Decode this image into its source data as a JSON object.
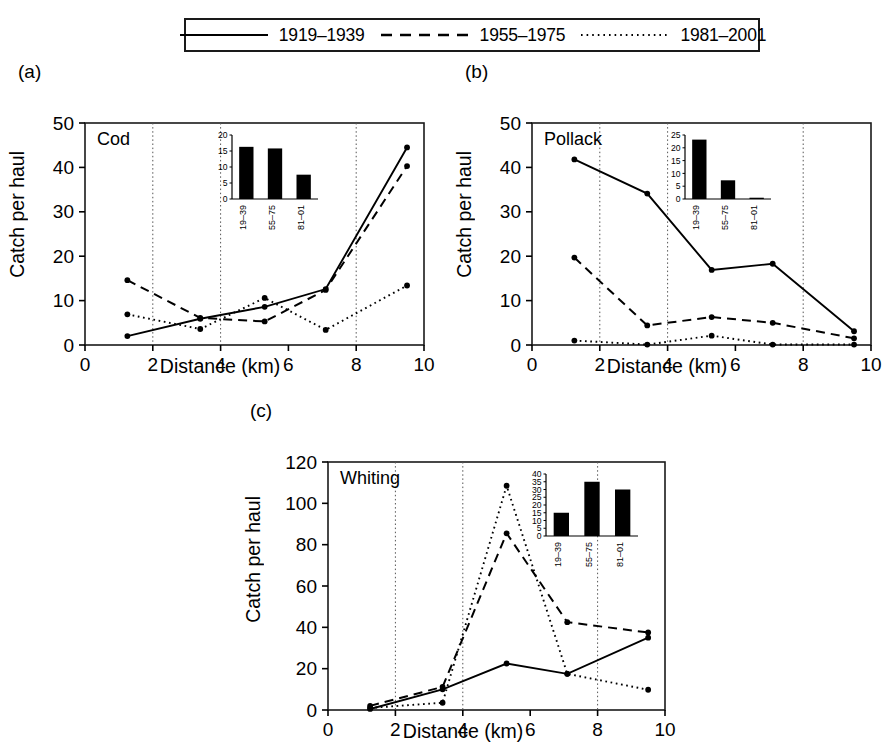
{
  "legend": {
    "entries": [
      {
        "label": "1919–1939",
        "style": "solid",
        "icon": "solid-line-icon"
      },
      {
        "label": "1955–1975",
        "style": "dashed",
        "icon": "dashed-line-icon"
      },
      {
        "label": "1981–2001",
        "style": "dotted",
        "icon": "dotted-line-icon"
      }
    ]
  },
  "axes": {
    "xlabel": "Distance (km)",
    "ylabel": "Catch per haul"
  },
  "panels": [
    {
      "tag": "(a)",
      "species": "Cod"
    },
    {
      "tag": "(b)",
      "species": "Pollack"
    },
    {
      "tag": "(c)",
      "species": "Whiting"
    }
  ],
  "chart_data": [
    {
      "type": "line",
      "panel": "(a)",
      "title": "Cod",
      "xlabel": "Distance (km)",
      "ylabel": "Catch per haul",
      "xlim": [
        0,
        10
      ],
      "ylim": [
        0,
        50
      ],
      "xticks": [
        0,
        2,
        4,
        6,
        8,
        10
      ],
      "yticks": [
        0,
        10,
        20,
        30,
        40,
        50
      ],
      "grid": "vertical dotted gridlines at x = 2, 4, 8",
      "gridlines_x": [
        2,
        4,
        8
      ],
      "legend_position": "top, outside (shared)",
      "x": [
        1.25,
        3.4,
        5.3,
        7.1,
        9.5
      ],
      "series": [
        {
          "name": "1919–1939",
          "style": "solid",
          "values": [
            2.0,
            5.9,
            8.6,
            12.6,
            44.5
          ]
        },
        {
          "name": "1955–1975",
          "style": "dashed",
          "values": [
            14.6,
            6.1,
            5.3,
            12.4,
            40.3
          ]
        },
        {
          "name": "1981–2001",
          "style": "dotted",
          "values": [
            6.9,
            3.6,
            10.6,
            3.4,
            13.4
          ]
        }
      ],
      "inset": {
        "type": "bar",
        "categories": [
          "19–39",
          "55–75",
          "81–01"
        ],
        "values": [
          16.3,
          15.8,
          7.6
        ],
        "ylim": [
          0,
          20
        ],
        "yticks": [
          0,
          5,
          10,
          15,
          20
        ]
      }
    },
    {
      "type": "line",
      "panel": "(b)",
      "title": "Pollack",
      "xlabel": "Distance (km)",
      "ylabel": "Catch per haul",
      "xlim": [
        0,
        10
      ],
      "ylim": [
        0,
        50
      ],
      "xticks": [
        0,
        2,
        4,
        6,
        8,
        10
      ],
      "yticks": [
        0,
        10,
        20,
        30,
        40,
        50
      ],
      "grid": "vertical dotted gridlines at x = 2, 4, 8",
      "gridlines_x": [
        2,
        4,
        8
      ],
      "legend_position": "top, outside (shared)",
      "x": [
        1.25,
        3.4,
        5.3,
        7.1,
        9.5
      ],
      "series": [
        {
          "name": "1919–1939",
          "style": "solid",
          "values": [
            41.8,
            34.1,
            16.9,
            18.3,
            3.1
          ]
        },
        {
          "name": "1955–1975",
          "style": "dashed",
          "values": [
            19.7,
            4.4,
            6.3,
            5.0,
            1.5
          ]
        },
        {
          "name": "1981–2001",
          "style": "dotted",
          "values": [
            1.0,
            0.1,
            2.1,
            0.1,
            0.1
          ]
        }
      ],
      "inset": {
        "type": "bar",
        "categories": [
          "19–39",
          "55–75",
          "81–01"
        ],
        "values": [
          23.2,
          7.3,
          0.5
        ],
        "ylim": [
          0,
          25
        ],
        "yticks": [
          0,
          5,
          10,
          15,
          20,
          25
        ]
      }
    },
    {
      "type": "line",
      "panel": "(c)",
      "title": "Whiting",
      "xlabel": "Distance (km)",
      "ylabel": "Catch per haul",
      "xlim": [
        0,
        10
      ],
      "ylim": [
        0,
        120
      ],
      "xticks": [
        0,
        2,
        4,
        6,
        8,
        10
      ],
      "yticks": [
        0,
        20,
        40,
        60,
        80,
        100,
        120
      ],
      "grid": "vertical dotted gridlines at x = 2, 4, 8",
      "gridlines_x": [
        2,
        4,
        8
      ],
      "legend_position": "top, outside (shared)",
      "x": [
        1.25,
        3.4,
        5.3,
        7.1,
        9.5
      ],
      "series": [
        {
          "name": "1919–1939",
          "style": "solid",
          "values": [
            0.5,
            10.0,
            22.5,
            17.5,
            35.0
          ]
        },
        {
          "name": "1955–1975",
          "style": "dashed",
          "values": [
            2.0,
            11.2,
            85.5,
            42.5,
            37.5
          ]
        },
        {
          "name": "1981–2001",
          "style": "dotted",
          "values": [
            1.0,
            3.5,
            108.5,
            17.5,
            9.8
          ]
        }
      ],
      "inset": {
        "type": "bar",
        "categories": [
          "19–39",
          "55–75",
          "81–01"
        ],
        "values": [
          15.0,
          35.0,
          30.0
        ],
        "ylim": [
          0,
          40
        ],
        "yticks": [
          0,
          5,
          10,
          15,
          20,
          25,
          30,
          35,
          40
        ]
      }
    }
  ]
}
